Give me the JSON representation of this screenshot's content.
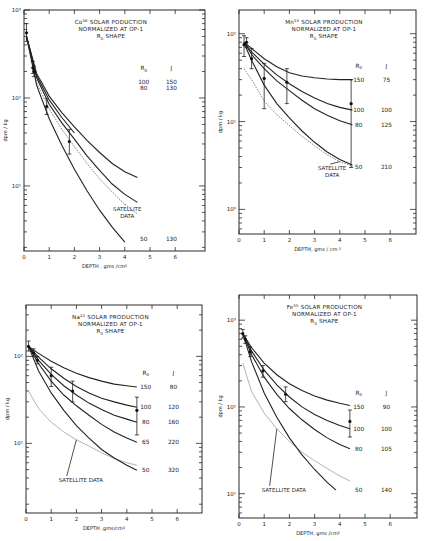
{
  "figure": {
    "layout": "2x2 grid of semi-log plots"
  },
  "chart_data": [
    {
      "type": "line",
      "id": "co56",
      "title_lines": [
        "Co56 SOLAR PODUCTION",
        "NORMALIZED AT OP-1",
        "R0 SHAPE"
      ],
      "title_isotope": "Co",
      "title_mass": "56",
      "title_rest": " SOLAR PODUCTION",
      "xlabel": "DEPTH , gms /cm²",
      "ylabel": "dpm / kg",
      "yscale": "log",
      "xlim": [
        0,
        7
      ],
      "ylim": [
        2,
        1000
      ],
      "xticks": [
        0,
        1,
        2,
        3,
        4,
        5,
        6
      ],
      "yticks": [
        {
          "v": 10,
          "label": "10¹"
        },
        {
          "v": 100,
          "label": "10²"
        },
        {
          "v": 1000,
          "label": "10³"
        }
      ],
      "px": {
        "x0": 24,
        "xunit": 25.2,
        "xr": 205,
        "ytop": 10,
        "ybot": 251,
        "ylogTop": 3,
        "ylogBot": 0.26
      },
      "legend_header": {
        "R0": "R0",
        "J": "J"
      },
      "series": [
        {
          "name": "R0=100, J=150",
          "R0": "100",
          "J": "150",
          "x": [
            0.1,
            0.5,
            1,
            1.5,
            2,
            2.5,
            3,
            3.5,
            4,
            4.5
          ],
          "y": [
            500,
            190,
            105,
            68,
            47,
            33,
            24,
            18,
            14.5,
            12.5
          ],
          "label_y": 150
        },
        {
          "name": "R0=80, J=130",
          "R0": "80",
          "J": "130",
          "x": [
            0.1,
            0.5,
            1,
            1.5,
            2,
            2.5,
            3,
            3.5,
            4,
            4.5
          ],
          "y": [
            500,
            170,
            85,
            52,
            34,
            22,
            15,
            10.5,
            8,
            6.5
          ],
          "label_y": 130
        },
        {
          "name": "R0=50, J=130",
          "R0": "50",
          "J": "130",
          "x": [
            0.1,
            0.5,
            1,
            1.5,
            2,
            2.5,
            3,
            3.5,
            4
          ],
          "y": [
            500,
            140,
            58,
            29,
            15.5,
            8.8,
            5.3,
            3.4,
            2.3
          ],
          "label_y": 2.5
        },
        {
          "name": "upper-mid",
          "x": [
            0.1,
            0.5,
            1,
            1.5,
            2
          ],
          "y": [
            500,
            180,
            95,
            60,
            40
          ],
          "unlabeled": true
        }
      ],
      "satellite": {
        "label": "SATELLITE DATA",
        "style": "dotted",
        "x": [
          0.1,
          0.5,
          1,
          1.5,
          2,
          2.5,
          3,
          3.5,
          4,
          4.5
        ],
        "y": [
          480,
          150,
          75,
          44,
          28,
          18,
          12,
          8.5,
          6.2,
          4.8
        ]
      },
      "measurements": [
        {
          "x": 0.1,
          "y": 550,
          "lo": 440,
          "hi": 700
        },
        {
          "x": 0.35,
          "y": 220,
          "lo": 190,
          "hi": 260
        },
        {
          "x": 0.4,
          "y": 200,
          "lo": 175,
          "hi": 230
        },
        {
          "x": 0.9,
          "y": 80,
          "lo": 65,
          "hi": 98
        },
        {
          "x": 1.8,
          "y": 32,
          "lo": 23,
          "hi": 44
        }
      ],
      "satellite_label_pos": {
        "x": 3.7,
        "y": 5.2
      }
    },
    {
      "type": "line",
      "id": "mn54",
      "title_isotope": "Mn",
      "title_mass": "54",
      "title_rest": " SOLAR PRODUCTION",
      "title_lines": [
        "Mn54 SOLAR PRODUCTION",
        "NORMALIZED AT OP-1",
        "R0 SHAPE"
      ],
      "xlabel": "DEPTH, gms / cm ²",
      "ylabel": "dpm / kg",
      "yscale": "log",
      "xlim": [
        0,
        7
      ],
      "ylim": [
        0.5,
        200
      ],
      "xticks": [
        0,
        1,
        2,
        3,
        4,
        5,
        6
      ],
      "yticks": [
        {
          "v": 1,
          "label": "10⁰"
        },
        {
          "v": 10,
          "label": "10¹"
        },
        {
          "v": 100,
          "label": "10²"
        }
      ],
      "px": {
        "x0": 239,
        "xunit": 25.2,
        "xr": 416,
        "ytop": 10,
        "ybot": 234,
        "ylogTop": 2.27,
        "ylogBot": -0.28
      },
      "legend_header": {
        "R0": "R0",
        "J": "J"
      },
      "series": [
        {
          "name": "R0=150, J=75",
          "R0": "150",
          "J": "75",
          "x": [
            0.2,
            0.5,
            1,
            1.5,
            2,
            2.5,
            3,
            3.5,
            4,
            4.5
          ],
          "y": [
            80,
            68,
            52,
            42,
            36,
            33,
            31.5,
            30.5,
            30,
            30
          ],
          "label_y": 30
        },
        {
          "name": "R0=100, J=100",
          "R0": "100",
          "J": "100",
          "x": [
            0.2,
            0.5,
            1,
            1.5,
            2,
            2.5,
            3,
            3.5,
            4,
            4.5
          ],
          "y": [
            80,
            62,
            45,
            34,
            27,
            22,
            18.5,
            16,
            14.5,
            13.5
          ],
          "label_y": 13.5
        },
        {
          "name": "R0=80, J=125",
          "R0": "80",
          "J": "125",
          "x": [
            0.2,
            0.5,
            1,
            1.5,
            2,
            2.5,
            3,
            3.5,
            4,
            4.5
          ],
          "y": [
            80,
            58,
            40,
            29,
            22.5,
            17.5,
            14,
            11.8,
            10.2,
            9.2
          ],
          "label_y": 9.2
        },
        {
          "name": "R0=50, J=210",
          "R0": "50",
          "J": "210",
          "x": [
            0.2,
            0.5,
            1,
            1.5,
            2,
            2.5,
            3,
            3.5,
            4,
            4.5
          ],
          "y": [
            78,
            50,
            26,
            16,
            11,
            7.8,
            5.8,
            4.5,
            3.7,
            3.2
          ],
          "label_y": 3.0
        }
      ],
      "satellite": {
        "label": "SATELLITE DATA",
        "style": "dotted",
        "x": [
          0.2,
          0.5,
          1,
          1.5,
          2,
          2.5,
          3,
          3.5,
          4,
          4.5
        ],
        "y": [
          40,
          30,
          17,
          12,
          9,
          6.8,
          5.3,
          4.2,
          3.5,
          3.1
        ]
      },
      "measurements": [
        {
          "x": 0.2,
          "y": 75,
          "lo": 55,
          "hi": 95
        },
        {
          "x": 0.3,
          "y": 80,
          "lo": 70,
          "hi": 90
        },
        {
          "x": 0.5,
          "y": 52,
          "lo": 40,
          "hi": 68
        },
        {
          "x": 1.0,
          "y": 31,
          "lo": 14,
          "hi": 46
        },
        {
          "x": 1.9,
          "y": 28,
          "lo": 16,
          "hi": 40
        },
        {
          "x": 4.45,
          "y": 16,
          "lo": 3,
          "hi": 30
        }
      ],
      "satellite_label_pos": {
        "x": 3.3,
        "y": 2.8
      }
    },
    {
      "type": "line",
      "id": "na22",
      "title_isotope": "Na",
      "title_mass": "22",
      "title_rest": " SOLAR PRODUCTION",
      "title_lines": [
        "Na22 SOLAR PRODUCTION",
        "NORMALIZED AT OP-1",
        "R0 SHAPE"
      ],
      "xlabel": "DEPTH ,gms/cm²",
      "ylabel": "dpm / kg",
      "yscale": "log",
      "xlim": [
        0,
        7
      ],
      "ylim": [
        1.8,
        300
      ],
      "xticks": [
        0,
        1,
        2,
        3,
        4,
        5,
        6
      ],
      "yticks": [
        {
          "v": 10,
          "label": "10¹"
        },
        {
          "v": 100,
          "label": "10²"
        }
      ],
      "px": {
        "x0": 26,
        "xunit": 25.2,
        "xr": 202,
        "ytop": 305,
        "ybot": 513,
        "ylogTop": 2.59,
        "ylogBot": 0.2
      },
      "legend_header": {
        "R0": "R0",
        "J": "J"
      },
      "series": [
        {
          "name": "R0=150, J=80",
          "R0": "150",
          "J": "80",
          "x": [
            0.1,
            0.5,
            1,
            1.5,
            2,
            2.5,
            3,
            3.5,
            4,
            4.4
          ],
          "y": [
            130,
            108,
            88,
            74,
            64,
            57,
            52,
            48,
            46,
            44.5
          ],
          "label_y": 45
        },
        {
          "name": "R0=100, J=120",
          "R0": "100",
          "J": "120",
          "x": [
            0.1,
            0.5,
            1,
            1.5,
            2,
            2.5,
            3,
            3.5,
            4,
            4.4
          ],
          "y": [
            130,
            98,
            72,
            56,
            45,
            38,
            33,
            30,
            27.5,
            26
          ],
          "label_y": 26
        },
        {
          "name": "R0=80, J=160",
          "R0": "80",
          "J": "160",
          "x": [
            0.1,
            0.5,
            1,
            1.5,
            2,
            2.5,
            3,
            3.5,
            4,
            4.4
          ],
          "y": [
            130,
            90,
            62,
            46,
            36,
            29,
            24.5,
            21,
            19,
            17.5
          ],
          "label_y": 17.5
        },
        {
          "name": "R0=65, J=220",
          "R0": "65",
          "J": "220",
          "x": [
            0.1,
            0.5,
            1,
            1.5,
            2,
            2.5,
            3,
            3.5,
            4,
            4.4
          ],
          "y": [
            130,
            82,
            52,
            36,
            27,
            21,
            16.5,
            13.5,
            11.5,
            10.3
          ],
          "label_y": 10.3
        },
        {
          "name": "R0=50, J=320",
          "R0": "50",
          "J": "320",
          "x": [
            0.1,
            0.5,
            1,
            1.5,
            2,
            2.5,
            3,
            3.5,
            4,
            4.4
          ],
          "y": [
            130,
            68,
            38,
            24,
            16,
            11.5,
            8.5,
            6.8,
            5.6,
            4.9
          ],
          "label_y": 5
        }
      ],
      "satellite": {
        "label": "SATELLITE DATA",
        "style": "solid-gray",
        "x": [
          0.1,
          0.5,
          1,
          1.5,
          2,
          2.5,
          3,
          3.5,
          4,
          4.4
        ],
        "y": [
          40,
          25,
          17.5,
          13.5,
          11,
          9.3,
          7.8,
          6.7,
          6.0,
          5.6
        ]
      },
      "measurements": [
        {
          "x": 0.1,
          "y": 130,
          "lo": 115,
          "hi": 150
        },
        {
          "x": 0.3,
          "y": 110,
          "lo": 100,
          "hi": 122
        },
        {
          "x": 0.45,
          "y": 90,
          "lo": 82,
          "hi": 100
        },
        {
          "x": 1.0,
          "y": 60,
          "lo": 45,
          "hi": 75
        },
        {
          "x": 1.85,
          "y": 40,
          "lo": 30,
          "hi": 52
        },
        {
          "x": 4.4,
          "y": 24,
          "lo": 12.5,
          "hi": 34
        }
      ],
      "satellite_label_pos": {
        "x": 1.3,
        "y": 3.6
      }
    },
    {
      "type": "line",
      "id": "fe55",
      "title_isotope": "Fe",
      "title_mass": "55",
      "title_rest": " SOLAR PRODUCTION",
      "title_lines": [
        "Fe55 SOLAR PRODUCTION",
        "NORMALIZED AT OP-1",
        "R0 SHAPE"
      ],
      "xlabel": "DEPTH, gms /cm²",
      "ylabel": "dpm / kg",
      "yscale": "log",
      "xlim": [
        0,
        7
      ],
      "ylim": [
        5,
        2000
      ],
      "xticks": [
        0,
        1,
        2,
        3,
        4,
        5,
        6
      ],
      "yticks": [
        {
          "v": 10,
          "label": "10¹"
        },
        {
          "v": 100,
          "label": "10²"
        },
        {
          "v": 1000,
          "label": "10³"
        }
      ],
      "px": {
        "x0": 239,
        "xunit": 25.2,
        "xr": 417,
        "ytop": 295,
        "ybot": 518,
        "ylogTop": 3.29,
        "ylogBot": 0.72
      },
      "legend_header": {
        "R0": "R0",
        "J": "J"
      },
      "series": [
        {
          "name": "R0=150, J=90",
          "R0": "150",
          "J": "90",
          "x": [
            0.15,
            0.5,
            1,
            1.5,
            2,
            2.5,
            3,
            3.5,
            4,
            4.4
          ],
          "y": [
            700,
            480,
            320,
            235,
            185,
            155,
            134,
            120,
            110,
            104
          ],
          "label_y": 100
        },
        {
          "name": "R0=100, J=100",
          "R0": "100",
          "J": "100",
          "x": [
            0.15,
            0.5,
            1,
            1.5,
            2,
            2.5,
            3,
            3.5,
            4,
            4.4
          ],
          "y": [
            700,
            440,
            265,
            180,
            130,
            100,
            82,
            70,
            61,
            56
          ],
          "label_y": 55
        },
        {
          "name": "R0=80, J=105",
          "R0": "80",
          "J": "105",
          "x": [
            0.15,
            0.5,
            1,
            1.5,
            2,
            2.5,
            3,
            3.5,
            4,
            4.4
          ],
          "y": [
            700,
            400,
            220,
            140,
            96,
            71,
            55,
            44,
            37,
            33
          ],
          "label_y": 33
        },
        {
          "name": "R0=50, J=140",
          "R0": "50",
          "J": "140",
          "x": [
            0.15,
            0.5,
            1,
            1.5,
            2,
            2.5,
            3,
            3.5,
            3.85
          ],
          "y": [
            700,
            330,
            145,
            76,
            44,
            28,
            19,
            13.5,
            11
          ],
          "label_y": 11
        }
      ],
      "satellite": {
        "label": "SATELLITE DATA",
        "style": "solid-gray",
        "x": [
          0.15,
          0.5,
          1,
          1.5,
          2,
          2.5,
          3,
          3.5,
          4,
          4.4
        ],
        "y": [
          320,
          150,
          85,
          56,
          40,
          30,
          24,
          19.5,
          16,
          14
        ]
      },
      "measurements": [
        {
          "x": 0.15,
          "y": 700,
          "lo": 620,
          "hi": 780
        },
        {
          "x": 0.25,
          "y": 600,
          "lo": 540,
          "hi": 660
        },
        {
          "x": 0.45,
          "y": 430,
          "lo": 380,
          "hi": 490
        },
        {
          "x": 0.95,
          "y": 260,
          "lo": 220,
          "hi": 300
        },
        {
          "x": 1.85,
          "y": 140,
          "lo": 115,
          "hi": 170
        },
        {
          "x": 4.4,
          "y": 68,
          "lo": 45,
          "hi": 92
        }
      ],
      "satellite_label_pos": {
        "x": 0.9,
        "y": 10.5
      }
    }
  ]
}
